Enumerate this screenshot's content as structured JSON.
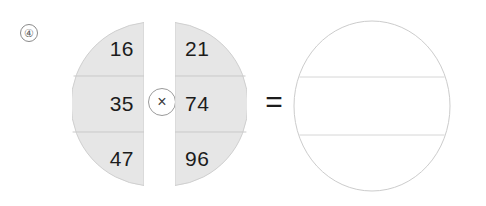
{
  "problem": {
    "number_label": "④",
    "operation": "multiplication",
    "expression_symbols": {
      "multiply": "×",
      "equals": "="
    }
  },
  "operands": [
    {
      "name": "left-operand",
      "side": "left",
      "shape": "left-half-disc",
      "fill_color": "#e6e6e6",
      "stroke_color": "#cfcfcf",
      "divider_color": "#c9c9c9",
      "values": [
        "16",
        "35",
        "47"
      ]
    },
    {
      "name": "right-operand",
      "side": "right",
      "shape": "right-half-disc",
      "fill_color": "#e6e6e6",
      "stroke_color": "#cfcfcf",
      "divider_color": "#c9c9c9",
      "values": [
        "21",
        "74",
        "96"
      ]
    }
  ],
  "answer": {
    "name": "answer-circle",
    "shape": "full-circle",
    "fill_color": "#ffffff",
    "stroke_color": "#cccccc",
    "divider_color": "#d6d6d6",
    "values": [
      "",
      "",
      ""
    ]
  },
  "colors": {
    "background": "#ffffff",
    "operand_fill": "#e6e6e6",
    "outline": "#cccccc",
    "text": "#1c1c1c",
    "marker_text": "#5c5c5c"
  }
}
